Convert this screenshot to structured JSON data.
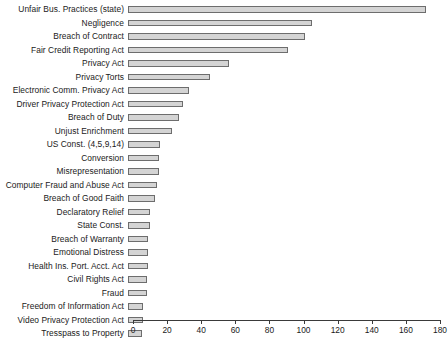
{
  "chart_data": {
    "type": "bar",
    "orientation": "horizontal",
    "title": "",
    "subtitle": "",
    "xlabel": "",
    "ylabel": "",
    "xlim": [
      0,
      180
    ],
    "xticks": [
      0,
      20,
      40,
      60,
      80,
      100,
      120,
      140,
      160,
      180
    ],
    "grid": false,
    "legend": null,
    "bar_fill_color": "#d4d4d4",
    "bar_border_color": "#6d6d6d",
    "background_color": "#ffffff",
    "categories": [
      "Unfair Bus. Practices (state)",
      "Negligence",
      "Breach of Contract",
      "Fair Credit Reporting Act",
      "Privacy Act",
      "Privacy Torts",
      "Electronic Comm. Privacy Act",
      "Driver Privacy Protection Act",
      "Breach of Duty",
      "Unjust Enrichment",
      "US Const. (4,5,9,14)",
      "Conversion",
      "Misrepresentation",
      "Computer Fraud and Abuse Act",
      "Breach of Good Faith",
      "Declaratory Relief",
      "State Const.",
      "Breach of Warranty",
      "Emotional Distress",
      "Health Ins. Port. Acct. Act",
      "Civil Rights Act",
      "Fraud",
      "Freedom of Information Act",
      "Video Privacy Protection Act",
      "Tresspass to Property"
    ],
    "values": [
      175,
      108,
      104,
      94,
      59,
      48,
      36,
      32,
      30,
      26,
      19,
      18,
      18,
      17,
      16,
      13,
      13,
      12,
      12,
      12,
      11,
      11,
      9,
      9,
      8
    ]
  }
}
